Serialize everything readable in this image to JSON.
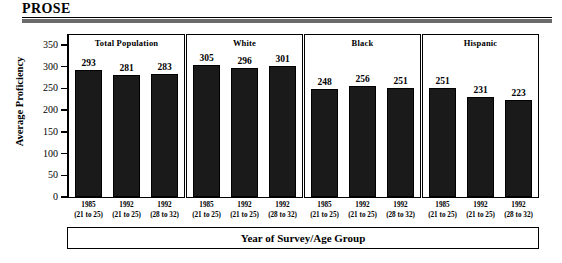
{
  "header": {
    "title": "PROSE",
    "rule_color": "#6b6b6b"
  },
  "chart_data": {
    "type": "bar",
    "title": "PROSE",
    "xlabel": "Year of Survey/Age Group",
    "ylabel": "Average Proficiency",
    "ylim": [
      0,
      350
    ],
    "yticks": [
      0,
      50,
      100,
      150,
      200,
      250,
      300,
      350
    ],
    "ytick_labels": [
      "0",
      "50",
      "100",
      "150",
      "200",
      "250",
      "300",
      "350"
    ],
    "grid": false,
    "legend": "none",
    "bar_color": "#1a1a1a",
    "categories": [
      "1985 (21 to 25)",
      "1992 (21 to 25)",
      "1992 (28 to 32)"
    ],
    "category_years": [
      "1985",
      "1992",
      "1992"
    ],
    "category_ages": [
      "(21 to 25)",
      "(21 to 25)",
      "(28 to 32)"
    ],
    "panels": [
      {
        "name": "Total Population",
        "values": [
          293,
          281,
          283
        ]
      },
      {
        "name": "White",
        "values": [
          305,
          296,
          301
        ]
      },
      {
        "name": "Black",
        "values": [
          248,
          256,
          251
        ]
      },
      {
        "name": "Hispanic",
        "values": [
          251,
          231,
          223
        ]
      }
    ]
  }
}
